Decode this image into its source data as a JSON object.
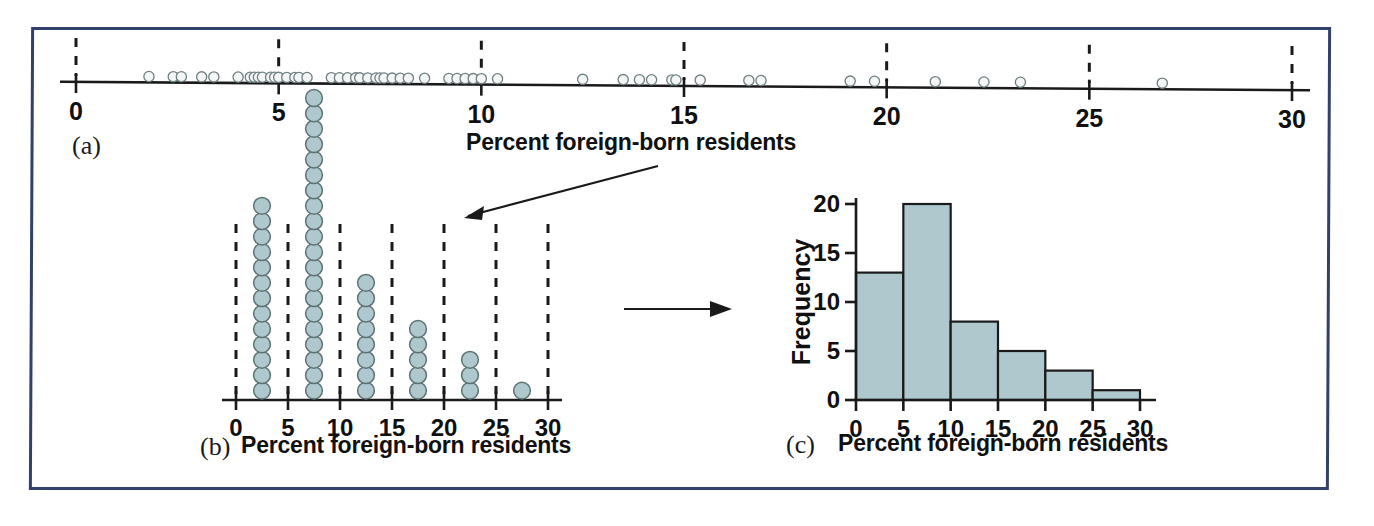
{
  "figure": {
    "panels": [
      {
        "letter": "(a)",
        "caption": "",
        "type": "dotplot-1d"
      },
      {
        "letter": "(b)",
        "caption": "Percent foreign-born residents",
        "type": "dotplot-stacked"
      },
      {
        "letter": "(c)",
        "caption": "Percent foreign-born residents",
        "type": "histogram"
      }
    ],
    "callout_label": "Percent foreign-born residents",
    "frame_color": "#32406b",
    "dot_fill_color": "#aec8cd",
    "dot_stroke_color": "#5d7275",
    "bar_fill_color": "#aec8cd",
    "axis_color": "#1a1a1a"
  },
  "chart_data": [
    {
      "type": "scatter",
      "panel": "(a)",
      "title": "Percent foreign-born residents",
      "xlabel": "Percent foreign-born residents",
      "ylabel": "",
      "xlim": [
        0,
        30
      ],
      "xticks": [
        0,
        5,
        10,
        15,
        20,
        25,
        30
      ],
      "xticklabels": [
        "0",
        "5",
        "10",
        "15",
        "20",
        "25",
        "30"
      ],
      "grid": "dashed-vertical-at-xticks",
      "legend": "none",
      "n": 50,
      "x": [
        1.8,
        2.4,
        2.6,
        3.1,
        3.4,
        4.0,
        4.3,
        4.4,
        4.5,
        4.6,
        4.8,
        4.9,
        5.0,
        5.2,
        5.4,
        5.5,
        5.7,
        6.3,
        6.5,
        6.7,
        6.9,
        7.0,
        7.2,
        7.4,
        7.5,
        7.6,
        7.8,
        8.0,
        8.2,
        8.6,
        9.2,
        9.4,
        9.6,
        9.8,
        10.0,
        10.4,
        12.5,
        13.5,
        13.9,
        14.2,
        14.7,
        14.8,
        15.4,
        16.6,
        16.9,
        19.1,
        19.7,
        21.2,
        22.4,
        23.3,
        26.8
      ],
      "y_jitter": 0
    },
    {
      "type": "bar",
      "panel": "(b)",
      "title": "Percent foreign-born residents",
      "xlabel": "Percent foreign-born residents",
      "ylabel": "Count of dots",
      "xlim": [
        0,
        30
      ],
      "xticks": [
        0,
        5,
        10,
        15,
        20,
        25,
        30
      ],
      "xticklabels": [
        "0",
        "5",
        "10",
        "15",
        "20",
        "25",
        "30"
      ],
      "categories": [
        "0-5",
        "5-10",
        "10-15",
        "15-20",
        "20-25",
        "25-30"
      ],
      "bin_centers": [
        2.5,
        7.5,
        12.5,
        17.5,
        22.5,
        27.5
      ],
      "values": [
        13,
        20,
        8,
        5,
        3,
        1
      ],
      "grid": "dashed-vertical-at-xticks",
      "legend": "none",
      "total": 50
    },
    {
      "type": "bar",
      "panel": "(c)",
      "title": "Percent foreign-born residents",
      "xlabel": "Percent foreign-born residents",
      "ylabel": "Frequency",
      "xlim": [
        0,
        30
      ],
      "ylim": [
        0,
        20
      ],
      "xticks": [
        0,
        5,
        10,
        15,
        20,
        25,
        30
      ],
      "xticklabels": [
        "0",
        "5",
        "10",
        "15",
        "20",
        "25",
        "30"
      ],
      "yticks": [
        0,
        5,
        10,
        15,
        20
      ],
      "yticklabels": [
        "0",
        "5",
        "10",
        "15",
        "20"
      ],
      "categories": [
        "0-5",
        "5-10",
        "10-15",
        "15-20",
        "20-25",
        "25-30"
      ],
      "values": [
        13,
        20,
        8,
        5,
        3,
        1
      ],
      "grid": "off",
      "legend": "none",
      "total": 50
    }
  ]
}
